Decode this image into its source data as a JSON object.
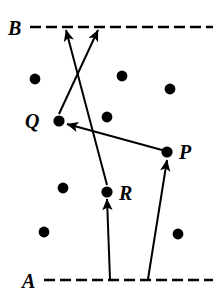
{
  "figure": {
    "type": "vector-diagram",
    "background_color": "#ffffff",
    "stroke_color": "#000000",
    "width": 219,
    "height": 300
  },
  "reference_lines": [
    {
      "name": "B",
      "label": "B",
      "label_x": 14,
      "label_y": 28,
      "y": 27,
      "x_start": 30,
      "x_end": 213,
      "style": "dashed",
      "dash": "11 5",
      "width": 2.6
    },
    {
      "name": "A",
      "label": "A",
      "label_x": 28,
      "label_y": 281,
      "y": 280,
      "x_start": 44,
      "x_end": 213,
      "style": "dashed",
      "dash": "11 5",
      "width": 2.6
    }
  ],
  "points": [
    {
      "id": "Q",
      "label": "Q",
      "x": 59,
      "y": 121,
      "r": 5.6,
      "label_x": 38,
      "label_y": 122,
      "label_anchor": "end"
    },
    {
      "id": "P",
      "label": "P",
      "x": 167,
      "y": 152,
      "r": 5.6,
      "label_x": 180,
      "label_y": 151,
      "label_anchor": "start"
    },
    {
      "id": "R",
      "label": "R",
      "x": 107,
      "y": 192,
      "r": 5.6,
      "label_x": 120,
      "label_y": 192,
      "label_anchor": "start"
    }
  ],
  "dots": [
    {
      "x": 35,
      "y": 79,
      "r": 5.4
    },
    {
      "x": 122,
      "y": 76,
      "r": 5.4
    },
    {
      "x": 170,
      "y": 89,
      "r": 5.4
    },
    {
      "x": 107,
      "y": 117,
      "r": 5.4
    },
    {
      "x": 63,
      "y": 188,
      "r": 5.4
    },
    {
      "x": 44,
      "y": 232,
      "r": 5.4
    },
    {
      "x": 178,
      "y": 234,
      "r": 5.4
    }
  ],
  "arrows": [
    {
      "name": "A-to-R",
      "from_label": "A line",
      "to_label": "R",
      "x1": 110,
      "y1": 279,
      "x2": 107,
      "y2": 199,
      "head": "end"
    },
    {
      "name": "A-to-P",
      "from_label": "A line",
      "to_label": "P",
      "x1": 148,
      "y1": 279,
      "x2": 167,
      "y2": 160,
      "head": "end"
    },
    {
      "name": "P-to-Q",
      "from_label": "P",
      "to_label": "Q",
      "x1": 162,
      "y1": 150,
      "x2": 67,
      "y2": 124,
      "head": "end"
    },
    {
      "name": "Q-to-B",
      "from_label": "Q",
      "to_label": "B line",
      "x1": 59,
      "y1": 114,
      "x2": 98,
      "y2": 30,
      "head": "end"
    },
    {
      "name": "R-to-B",
      "from_label": "R",
      "to_label": "B line",
      "x1": 107,
      "y1": 185,
      "x2": 66,
      "y2": 30,
      "head": "end"
    }
  ],
  "labels": {
    "A": "A",
    "B": "B",
    "P": "P",
    "Q": "Q",
    "R": "R"
  }
}
